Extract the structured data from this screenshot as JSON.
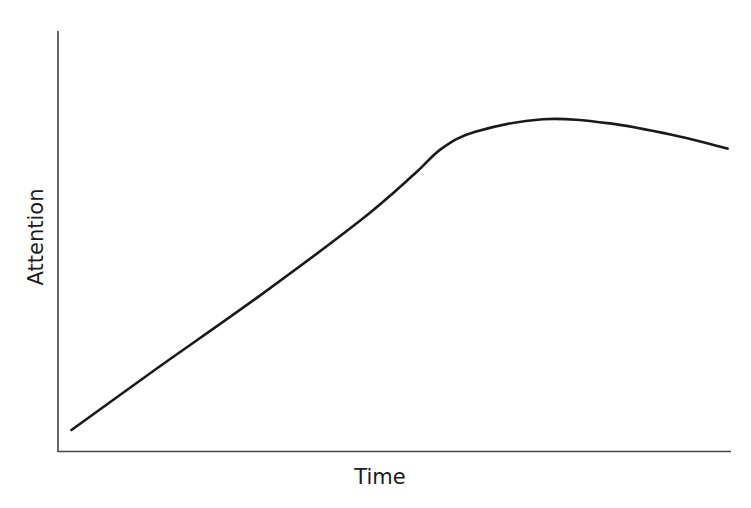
{
  "chart_data": {
    "type": "line",
    "title": "",
    "xlabel": "Time",
    "ylabel": "Attention",
    "grid": false,
    "legend": null,
    "ticks": {
      "x": [],
      "y": []
    },
    "series": [
      {
        "name": "Attention",
        "color": "#1a1a1a",
        "points": [
          {
            "x": 0.02,
            "y": 0.05
          },
          {
            "x": 0.15,
            "y": 0.2
          },
          {
            "x": 0.3,
            "y": 0.37
          },
          {
            "x": 0.45,
            "y": 0.55
          },
          {
            "x": 0.53,
            "y": 0.66
          },
          {
            "x": 0.57,
            "y": 0.72
          },
          {
            "x": 0.62,
            "y": 0.76
          },
          {
            "x": 0.72,
            "y": 0.79
          },
          {
            "x": 0.82,
            "y": 0.78
          },
          {
            "x": 0.92,
            "y": 0.75
          },
          {
            "x": 0.995,
            "y": 0.72
          }
        ]
      }
    ],
    "xlim": [
      0,
      1
    ],
    "ylim": [
      0,
      1
    ]
  },
  "colors": {
    "axis": "#444444",
    "line": "#1a1a1a",
    "background": "#ffffff"
  }
}
